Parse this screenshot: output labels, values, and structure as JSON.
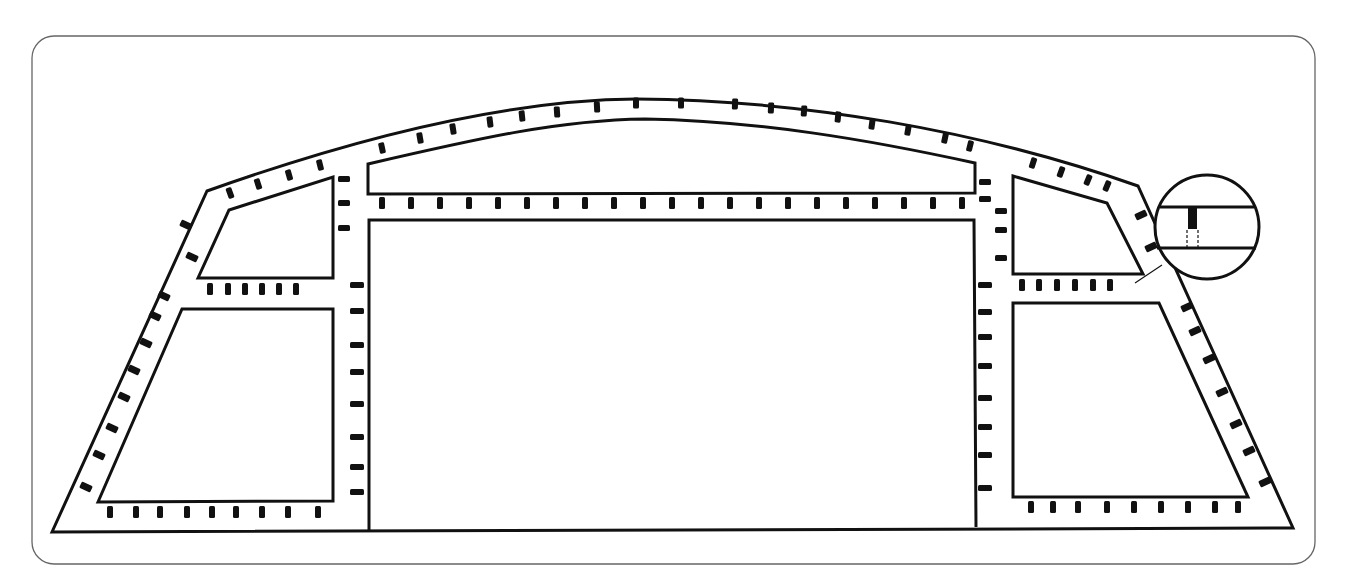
{
  "figure": {
    "caption": "",
    "colors": {
      "line": "#111111",
      "frame": "#666666",
      "background": "#ffffff"
    },
    "parts": [
      {
        "id": "outer-outline",
        "shape": "arched trapezoid"
      },
      {
        "id": "top-center-window",
        "shape": "arched strip"
      },
      {
        "id": "center-window",
        "shape": "rectangle"
      },
      {
        "id": "upper-left-window",
        "shape": "trapezoid"
      },
      {
        "id": "lower-left-window",
        "shape": "trapezoid"
      },
      {
        "id": "upper-right-window",
        "shape": "trapezoid"
      },
      {
        "id": "lower-right-window",
        "shape": "trapezoid"
      },
      {
        "id": "detail-callout",
        "shape": "circle",
        "content": "section showing a fastener between two rails"
      }
    ]
  }
}
